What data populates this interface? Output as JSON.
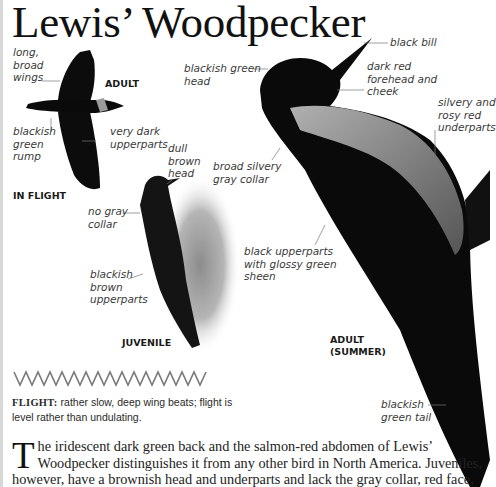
{
  "page": {
    "title": "Lewis’ Woodpecker"
  },
  "flight_illustration": {
    "caption": "IN FLIGHT",
    "age_label": "ADULT",
    "labels": {
      "wings": "long,\nbroad\nwings",
      "rump": "blackish\ngreen\nrump",
      "upperparts": "very dark\nupperparts"
    }
  },
  "juvenile_illustration": {
    "caption": "JUVENILE",
    "labels": {
      "head": "dull\nbrown\nhead",
      "collar": "no gray\ncollar",
      "upperparts": "blackish\nbrown\nupperparts"
    }
  },
  "adult_illustration": {
    "caption": "ADULT\n(SUMMER)",
    "labels": {
      "head": "blackish green\nhead",
      "bill": "black bill",
      "forehead": "dark red\nforehead and\ncheek",
      "underparts": "silvery and\nrosy red\nunderparts",
      "collar": "broad silvery\ngray collar",
      "upperparts": "black upperparts\nwith glossy green\nsheen",
      "tail": "blackish\ngreen tail"
    }
  },
  "flight_pattern": {
    "pattern_icon": "zigzag-flight-path-icon",
    "heading": "FLIGHT:",
    "text": "rather slow, deep wing beats; flight is level rather than undulating."
  },
  "description": {
    "dropcap": "T",
    "text": "he iridescent dark green back and the salmon-red abdomen of Lewis’ Woodpecker distinguishes it from any other bird in North America. Juveniles, however, have a brownish head and underparts and lack the gray collar, red face,"
  },
  "colors": {
    "ink": "#111111",
    "label_text": "#3a3a3a",
    "leader_line": "#777777",
    "zigzag": "#7a7a7a"
  }
}
